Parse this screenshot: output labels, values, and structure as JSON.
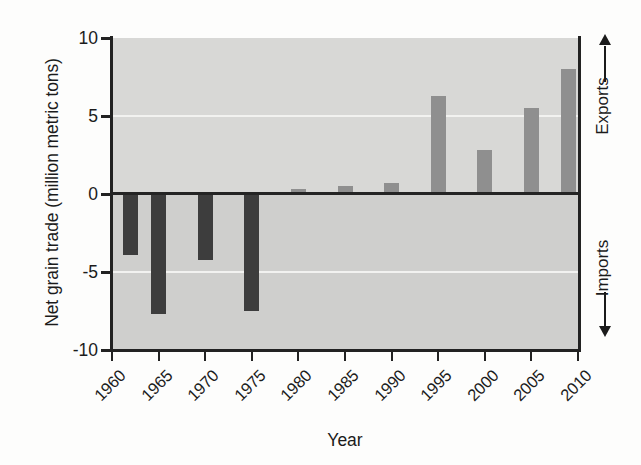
{
  "chart_data": {
    "type": "bar",
    "title": "",
    "xlabel": "Year",
    "ylabel": "Net grain trade (million metric tons)",
    "ylim": [
      -10,
      10
    ],
    "xlim": [
      1960,
      2010
    ],
    "grid": true,
    "legend_position": "none",
    "ytick_labels": [
      "10",
      "5",
      "0",
      "-5",
      "-10"
    ],
    "ytick_values": [
      10,
      5,
      0,
      -5,
      -10
    ],
    "xtick_labels": [
      "1960",
      "1965",
      "1970",
      "1975",
      "1980",
      "1985",
      "1990",
      "1995",
      "2000",
      "2005",
      "2010"
    ],
    "xtick_values": [
      1960,
      1965,
      1970,
      1975,
      1980,
      1985,
      1990,
      1995,
      2000,
      2005,
      2010
    ],
    "x": [
      1962,
      1965,
      1970,
      1975,
      1980,
      1985,
      1990,
      1995,
      2000,
      2005,
      2009
    ],
    "values": [
      -3.9,
      -7.7,
      -4.2,
      -7.5,
      0.3,
      0.5,
      0.7,
      6.3,
      2.8,
      5.5,
      8.0
    ],
    "series": [
      {
        "name": "Net grain trade",
        "values": [
          -3.9,
          -7.7,
          -4.2,
          -7.5,
          0.3,
          0.5,
          0.7,
          6.3,
          2.8,
          5.5,
          8.0
        ]
      }
    ],
    "annotations": [
      {
        "text": "Exports",
        "position": "right-upper",
        "arrow": "up"
      },
      {
        "text": "Imports",
        "position": "right-lower",
        "arrow": "down"
      }
    ],
    "colors": {
      "negative_bar": "#3d3d3d",
      "positive_bar": "#8f8f8f",
      "plot_background": "#d3d3d1",
      "gridline": "#f2f2f0",
      "axis": "#222222"
    }
  },
  "axis": {
    "y_title": "Net grain trade (million metric tons)",
    "x_title": "Year"
  },
  "side_labels": {
    "exports": "Exports",
    "imports": "Imports",
    "up_arrow": "↑",
    "down_arrow": "↓"
  }
}
